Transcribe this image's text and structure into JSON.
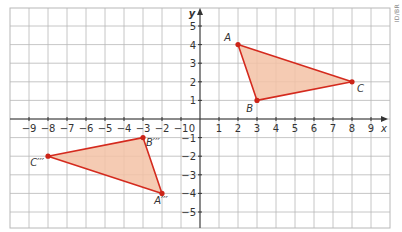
{
  "diagram": {
    "type": "coordinate-plane-transformation",
    "credit": "ID/BR",
    "axes": {
      "x_label": "x",
      "y_label": "y",
      "origin_label": "0",
      "x_ticks": [
        -9,
        -8,
        -7,
        -6,
        -5,
        -4,
        -3,
        -2,
        -1,
        1,
        2,
        3,
        4,
        5,
        6,
        7,
        8,
        9
      ],
      "x_tick_labels": [
        "−9",
        "−8",
        "−7",
        "−6",
        "−5",
        "−4",
        "−3",
        "−2",
        "−1",
        "1",
        "2",
        "3",
        "4",
        "5",
        "6",
        "7",
        "8",
        "9"
      ],
      "y_ticks": [
        5,
        4,
        3,
        2,
        1,
        -1,
        -2,
        -3,
        -4,
        -5
      ],
      "y_tick_labels": [
        "5",
        "4",
        "3",
        "2",
        "1",
        "−1",
        "−2",
        "−3",
        "−4",
        "−5"
      ],
      "x_range": [
        -10,
        10
      ],
      "y_range": [
        -6,
        6
      ]
    },
    "colors": {
      "grid": "#b8b8b8",
      "axis": "#333333",
      "shape_stroke": "#d42a1e",
      "shape_fill": "#f3c2a6",
      "point": "#cc2418",
      "label": "#333333"
    },
    "shapes": [
      {
        "name": "triangle-abc",
        "vertices": [
          {
            "label": "A",
            "x": 2,
            "y": 4
          },
          {
            "label": "B",
            "x": 3,
            "y": 1
          },
          {
            "label": "C",
            "x": 8,
            "y": 2
          }
        ]
      },
      {
        "name": "triangle-a3b3c3",
        "vertices": [
          {
            "label": "A′′′",
            "x": -2,
            "y": -4
          },
          {
            "label": "B′′′",
            "x": -3,
            "y": -1
          },
          {
            "label": "C′′′",
            "x": -8,
            "y": -2
          }
        ]
      }
    ]
  }
}
